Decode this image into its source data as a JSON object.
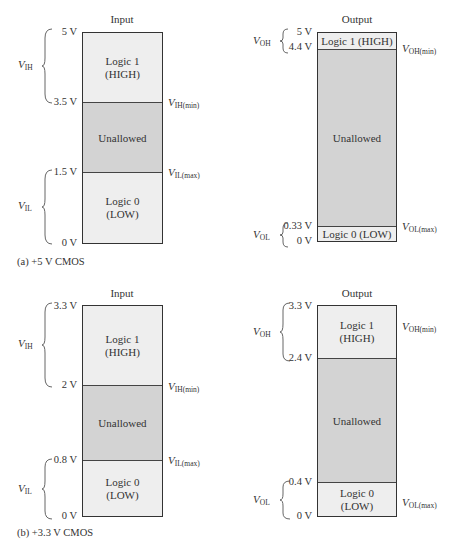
{
  "panels": [
    {
      "caption": "(a)  +5 V CMOS",
      "input": {
        "title": "Input",
        "ticks": [
          "5 V",
          "3.5 V",
          "1.5 V",
          "0 V"
        ],
        "regions": [
          {
            "label": "Logic 1\n(HIGH)",
            "line1": "Logic 1",
            "line2": "(HIGH)",
            "type": "logic"
          },
          {
            "label": "Unallowed",
            "type": "unallowed"
          },
          {
            "label": "Logic 0\n(LOW)",
            "line1": "Logic 0",
            "line2": "(LOW)",
            "type": "logic"
          }
        ],
        "range_labels": [
          {
            "main": "V",
            "sub": "IH"
          },
          {
            "main": "V",
            "sub": "IL"
          }
        ],
        "threshold_labels": [
          {
            "main": "V",
            "sub": "IH(min)"
          },
          {
            "main": "V",
            "sub": "IL(max)"
          }
        ]
      },
      "output": {
        "title": "Output",
        "ticks": [
          "5 V",
          "4.4 V",
          "0.33 V",
          "0 V"
        ],
        "regions": [
          {
            "label": "Logic 1 (HIGH)",
            "type": "logic"
          },
          {
            "label": "Unallowed",
            "type": "unallowed"
          },
          {
            "label": "Logic 0 (LOW)",
            "type": "logic"
          }
        ],
        "range_labels": [
          {
            "main": "V",
            "sub": "OH"
          },
          {
            "main": "V",
            "sub": "OL"
          }
        ],
        "threshold_labels": [
          {
            "main": "V",
            "sub": "OH(min)"
          },
          {
            "main": "V",
            "sub": "OL(max)"
          }
        ]
      }
    },
    {
      "caption": "(b)  +3.3 V CMOS",
      "input": {
        "title": "Input",
        "ticks": [
          "3.3 V",
          "2 V",
          "0.8 V",
          "0 V"
        ],
        "regions": [
          {
            "line1": "Logic 1",
            "line2": "(HIGH)",
            "type": "logic"
          },
          {
            "label": "Unallowed",
            "type": "unallowed"
          },
          {
            "line1": "Logic 0",
            "line2": "(LOW)",
            "type": "logic"
          }
        ],
        "range_labels": [
          {
            "main": "V",
            "sub": "IH"
          },
          {
            "main": "V",
            "sub": "IL"
          }
        ],
        "threshold_labels": [
          {
            "main": "V",
            "sub": "IH(min)"
          },
          {
            "main": "V",
            "sub": "IL(max)"
          }
        ]
      },
      "output": {
        "title": "Output",
        "ticks": [
          "3.3 V",
          "2.4 V",
          "0.4 V",
          "0 V"
        ],
        "regions": [
          {
            "line1": "Logic 1",
            "line2": "(HIGH)",
            "type": "logic"
          },
          {
            "label": "Unallowed",
            "type": "unallowed"
          },
          {
            "line1": "Logic 0",
            "line2": "(LOW)",
            "type": "logic"
          }
        ],
        "range_labels": [
          {
            "main": "V",
            "sub": "OH"
          },
          {
            "main": "V",
            "sub": "OL"
          }
        ],
        "threshold_labels": [
          {
            "main": "V",
            "sub": "OH(min)"
          },
          {
            "main": "V",
            "sub": "OL(max)"
          }
        ]
      }
    }
  ],
  "colors": {
    "logic_region": "#eeeeee",
    "unallowed_region": "#d3d3d3",
    "border": "#333333"
  }
}
